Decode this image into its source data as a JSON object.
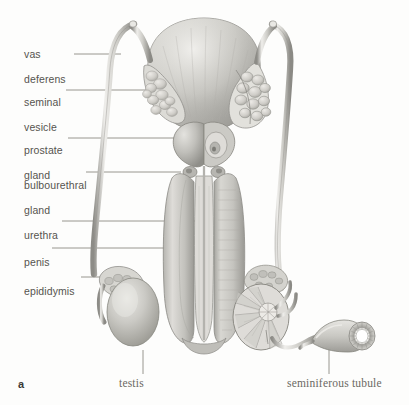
{
  "figure": {
    "panel_letter": "a",
    "title_implicit": "Male reproductive system",
    "background_color": "#fdfdfc",
    "label_color": "#56544f",
    "leader_color": "#8c8a85",
    "ink_dark": "#6f6e6b",
    "ink_mid": "#a9a8a4",
    "ink_light": "#d4d3cf"
  },
  "labels": {
    "left": [
      {
        "id": "vas-deferens",
        "text": "vas\ndeferens",
        "line1": "vas",
        "line2": "deferens",
        "x": 18,
        "y": 35,
        "leader_from_x": 74,
        "leader_to_x": 121,
        "leader_y": 54
      },
      {
        "id": "seminal-vesicle",
        "text": "seminal\nvesicle",
        "line1": "seminal",
        "line2": "vesicle",
        "x": 18,
        "y": 83,
        "leader_from_x": 66,
        "leader_to_x": 190,
        "leader_y": 90
      },
      {
        "id": "prostate-gland",
        "text": "prostate\ngland",
        "line1": "prostate",
        "line2": "gland",
        "x": 18,
        "y": 131,
        "leader_from_x": 68,
        "leader_to_x": 181,
        "leader_y": 138
      },
      {
        "id": "bulbourethral-gland",
        "text": "bulbourethral\ngland",
        "line1": "bulbourethral",
        "line2": "gland",
        "x": 18,
        "y": 166,
        "leader_from_x": 86,
        "leader_to_x": 181,
        "leader_y": 172
      },
      {
        "id": "urethra",
        "text": "urethra",
        "line1": "urethra",
        "line2": "",
        "x": 18,
        "y": 216,
        "leader_from_x": 62,
        "leader_to_x": 196,
        "leader_y": 221
      },
      {
        "id": "penis",
        "text": "penis",
        "line1": "penis",
        "line2": "",
        "x": 18,
        "y": 243,
        "leader_from_x": 52,
        "leader_to_x": 168,
        "leader_y": 248
      },
      {
        "id": "epididymis",
        "text": "epididymis",
        "line1": "epididymis",
        "line2": "",
        "x": 18,
        "y": 272,
        "leader_from_x": 81,
        "leader_to_x": 131,
        "leader_y": 277
      }
    ],
    "bottom": [
      {
        "id": "testis",
        "text": "testis",
        "x": 119,
        "y": 384,
        "leader_x": 143,
        "leader_from_y": 350,
        "leader_to_y": 374
      },
      {
        "id": "seminiferous-tubule",
        "text": "seminiferous tubule",
        "x": 287,
        "y": 384,
        "leader_x": 329,
        "leader_from_y": 348,
        "leader_to_y": 374
      }
    ]
  },
  "structures": [
    {
      "name": "bladder",
      "description": "large rounded dome at top center"
    },
    {
      "name": "seminal-vesicle-left",
      "description": "lobulated sac on left of bladder base"
    },
    {
      "name": "seminal-vesicle-right",
      "description": "cut-away lobulated sac on right of bladder base"
    },
    {
      "name": "vas-deferens-left",
      "description": "long tube curving down left side"
    },
    {
      "name": "vas-deferens-right",
      "description": "long tube curving down right side"
    },
    {
      "name": "prostate-gland",
      "description": "heart shaped bilobed gland below bladder"
    },
    {
      "name": "bulbourethral-gland",
      "description": "paired small glands below prostate"
    },
    {
      "name": "penis-shaft",
      "description": "vertical shaft, left solid and right sectioned"
    },
    {
      "name": "urethra",
      "description": "central canal running through penis shaft"
    },
    {
      "name": "testis-left",
      "description": "ovoid gland lower left with epididymis cap"
    },
    {
      "name": "epididymis-left",
      "description": "coiled cap over upper left testis"
    },
    {
      "name": "testis-right-section",
      "description": "cut-away testis showing lobules and rete testis"
    },
    {
      "name": "seminiferous-tubule",
      "description": "enlarged tubule with cross-section ring at lower right"
    }
  ]
}
